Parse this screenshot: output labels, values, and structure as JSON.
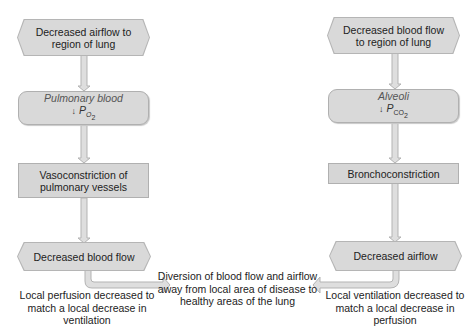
{
  "left_chain": {
    "start": "Decreased airflow to region of lung",
    "state_line1": "Pulmonary blood",
    "state_arrow": "↓",
    "state_var": "P",
    "state_sub": "O",
    "state_sub2": "2",
    "response": "Vasoconstriction of pulmonary vessels",
    "result": "Decreased blood flow",
    "caption": "Local perfusion decreased to match a local decrease in ventilation"
  },
  "right_chain": {
    "start": "Decreased blood flow to region of lung",
    "state_line1": "Alveoli",
    "state_arrow": "↓",
    "state_var": "P",
    "state_sub": "CO",
    "state_sub2": "2",
    "response": "Bronchoconstriction",
    "result": "Decreased airflow",
    "caption": "Local ventilation decreased to match a local decrease in perfusion"
  },
  "center_caption": "Diversion of blood flow and airflow away from local area of disease to healthy areas of the lung",
  "colors": {
    "box_fill": "#d9d9d9",
    "box_border": "#b0b0b0",
    "arrow_fill": "#dcdcdc",
    "text": "#222222"
  }
}
